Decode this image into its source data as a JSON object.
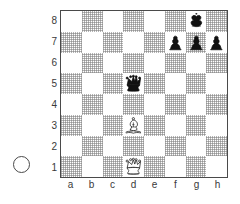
{
  "diagram": {
    "type": "chess-diagram",
    "turn_indicator": {
      "name": "side-to-move-circle",
      "color": "white",
      "meaning": "White to move"
    },
    "board": {
      "files": [
        "a",
        "b",
        "c",
        "d",
        "e",
        "f",
        "g",
        "h"
      ],
      "ranks": [
        "8",
        "7",
        "6",
        "5",
        "4",
        "3",
        "2",
        "1"
      ],
      "light_square_color": "#ffffff",
      "dark_square_color": "#c8c8c8",
      "border_color": "#4a4a4a",
      "orientation": "white-bottom"
    },
    "position": {
      "fen": "6k1/5ppp/8/3q4/8/3B4/8/3Q4 w - - 0 1",
      "pieces": [
        {
          "square": "g8",
          "color": "black",
          "type": "king",
          "glyph": "♚"
        },
        {
          "square": "f7",
          "color": "black",
          "type": "pawn",
          "glyph": "♟"
        },
        {
          "square": "g7",
          "color": "black",
          "type": "pawn",
          "glyph": "♟"
        },
        {
          "square": "h7",
          "color": "black",
          "type": "pawn",
          "glyph": "♟"
        },
        {
          "square": "d5",
          "color": "black",
          "type": "queen",
          "glyph": "♛"
        },
        {
          "square": "d3",
          "color": "white",
          "type": "bishop",
          "glyph": "♗"
        },
        {
          "square": "d1",
          "color": "white",
          "type": "queen",
          "glyph": "♕"
        }
      ]
    }
  }
}
